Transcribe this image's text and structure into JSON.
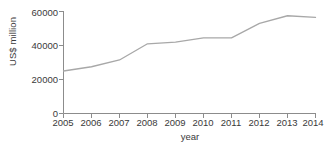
{
  "chart_data": {
    "type": "line",
    "title": "",
    "xlabel": "year",
    "ylabel": "US$ million",
    "categories": [
      "2005",
      "2006",
      "2007",
      "2008",
      "2009",
      "2010",
      "2011",
      "2012",
      "2013",
      "2014"
    ],
    "x": [
      2005,
      2006,
      2007,
      2008,
      2009,
      2010,
      2011,
      2012,
      2013,
      2014
    ],
    "values": [
      25000,
      27500,
      31500,
      41000,
      42000,
      44500,
      44500,
      53000,
      57500,
      56500
    ],
    "series": [
      {
        "name": "US$ million",
        "values": [
          25000,
          27500,
          31500,
          41000,
          42000,
          44500,
          44500,
          53000,
          57500,
          56500
        ]
      }
    ],
    "ylim": [
      0,
      60000
    ],
    "yticks": [
      0,
      20000,
      40000,
      60000
    ],
    "ytick_labels": [
      "0",
      "20000",
      "40000",
      "60000"
    ],
    "xtick_labels": [
      "2005",
      "2006",
      "2007",
      "2008",
      "2009",
      "2010",
      "2011",
      "2012",
      "2013",
      "2014"
    ],
    "grid": false,
    "legend": false,
    "legend_position": "none",
    "markers": false,
    "line_color": "#a8a8a8",
    "axis_color": "#8c8c8c",
    "text_color": "#3a3a3a",
    "background_color": "#ffffff"
  },
  "axes": {
    "y_title": "US$ million",
    "x_title": "year"
  }
}
